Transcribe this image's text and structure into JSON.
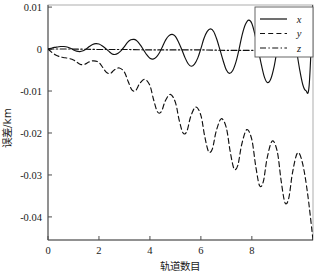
{
  "chart_data": {
    "type": "line",
    "title": "",
    "xlabel": "轨道数目",
    "ylabel": "误差/km",
    "xlim": [
      0,
      10.4
    ],
    "ylim": [
      -0.0455,
      0.0105
    ],
    "grid": false,
    "legend_position": "top-right",
    "xticks": [
      0,
      2,
      4,
      6,
      8
    ],
    "xtick_labels": [
      "0",
      "2",
      "4",
      "6",
      "8"
    ],
    "yticks": [
      0.01,
      0,
      -0.01,
      -0.02,
      -0.03,
      -0.04
    ],
    "ytick_labels": [
      "0.01",
      "0",
      "-0.01",
      "-0.02",
      "-0.03",
      "-0.04"
    ],
    "series": [
      {
        "name": "x",
        "style": "solid",
        "color": "#111111",
        "x": [
          0,
          0.12,
          0.25,
          0.38,
          0.5,
          0.62,
          0.75,
          0.88,
          1.0,
          1.12,
          1.25,
          1.38,
          1.5,
          1.62,
          1.75,
          1.88,
          2.0,
          2.12,
          2.25,
          2.38,
          2.5,
          2.62,
          2.75,
          2.88,
          3.0,
          3.12,
          3.25,
          3.38,
          3.5,
          3.62,
          3.75,
          3.88,
          4.0,
          4.12,
          4.25,
          4.38,
          4.5,
          4.62,
          4.75,
          4.88,
          5.0,
          5.12,
          5.25,
          5.38,
          5.5,
          5.62,
          5.75,
          5.88,
          6.0,
          6.12,
          6.25,
          6.38,
          6.5,
          6.62,
          6.75,
          6.88,
          7.0,
          7.12,
          7.25,
          7.38,
          7.5,
          7.62,
          7.75,
          7.88,
          8.0,
          8.12,
          8.25,
          8.38,
          8.5,
          8.62,
          8.75,
          8.88,
          9.0,
          9.12,
          9.25,
          9.38,
          9.5,
          9.62,
          9.75,
          9.88,
          10.0,
          10.12,
          10.25,
          10.4
        ],
        "y": [
          0.0,
          0.0002,
          0.0004,
          0.0005,
          0.0006,
          0.0006,
          0.0005,
          0.0002,
          -0.0002,
          -0.0005,
          -0.0006,
          -0.0004,
          0.0,
          0.0006,
          0.0011,
          0.0013,
          0.0012,
          0.0008,
          0.0002,
          -0.0005,
          -0.0011,
          -0.0013,
          -0.001,
          -0.0003,
          0.0006,
          0.0016,
          0.0022,
          0.0023,
          0.0019,
          0.001,
          -0.0002,
          -0.0014,
          -0.0022,
          -0.0024,
          -0.0019,
          -0.0008,
          0.0007,
          0.0022,
          0.0032,
          0.0035,
          0.003,
          0.0017,
          -0.0001,
          -0.0021,
          -0.0035,
          -0.0041,
          -0.0036,
          -0.0021,
          0.0001,
          0.0025,
          0.0042,
          0.0048,
          0.0042,
          0.0024,
          -0.0002,
          -0.0029,
          -0.005,
          -0.0058,
          -0.0051,
          -0.003,
          0.0,
          0.0034,
          0.0059,
          0.0069,
          0.0061,
          0.0035,
          -0.0001,
          -0.0039,
          -0.0068,
          -0.008,
          -0.007,
          -0.004,
          0.0002,
          0.0046,
          0.008,
          0.0092,
          0.008,
          0.0045,
          -0.0002,
          -0.005,
          -0.0085,
          -0.0099,
          -0.0086,
          0.0105
        ]
      },
      {
        "name": "y",
        "style": "dashed",
        "color": "#111111",
        "x": [
          0,
          0.15,
          0.3,
          0.45,
          0.6,
          0.8,
          1.0,
          1.15,
          1.3,
          1.45,
          1.6,
          1.8,
          2.0,
          2.15,
          2.3,
          2.45,
          2.6,
          2.8,
          3.0,
          3.15,
          3.3,
          3.45,
          3.6,
          3.8,
          4.0,
          4.15,
          4.3,
          4.45,
          4.6,
          4.8,
          5.0,
          5.15,
          5.3,
          5.45,
          5.6,
          5.8,
          6.0,
          6.15,
          6.3,
          6.45,
          6.6,
          6.8,
          7.0,
          7.15,
          7.3,
          7.45,
          7.6,
          7.8,
          8.0,
          8.15,
          8.3,
          8.45,
          8.6,
          8.8,
          9.0,
          9.15,
          9.3,
          9.45,
          9.6,
          9.8,
          10.0,
          10.2,
          10.4
        ],
        "y": [
          0.0,
          -0.0008,
          -0.0014,
          -0.0018,
          -0.002,
          -0.0022,
          -0.0026,
          -0.0032,
          -0.0037,
          -0.0036,
          -0.0031,
          -0.0028,
          -0.0032,
          -0.0044,
          -0.0056,
          -0.0058,
          -0.005,
          -0.0045,
          -0.0055,
          -0.0078,
          -0.0098,
          -0.0098,
          -0.0082,
          -0.0072,
          -0.0087,
          -0.0122,
          -0.015,
          -0.0149,
          -0.0124,
          -0.0108,
          -0.0127,
          -0.017,
          -0.02,
          -0.0196,
          -0.0161,
          -0.0138,
          -0.0158,
          -0.0208,
          -0.0244,
          -0.0238,
          -0.0196,
          -0.0166,
          -0.0188,
          -0.0244,
          -0.0285,
          -0.0277,
          -0.0228,
          -0.0192,
          -0.0216,
          -0.0278,
          -0.0325,
          -0.0316,
          -0.026,
          -0.0219,
          -0.0245,
          -0.0314,
          -0.0366,
          -0.0355,
          -0.0293,
          -0.0247,
          -0.0275,
          -0.035,
          -0.0455
        ]
      },
      {
        "name": "z",
        "style": "dashdot",
        "color": "#111111",
        "x": [
          0,
          1,
          2,
          3,
          4,
          5,
          6,
          7,
          8,
          9,
          10,
          10.4
        ],
        "y": [
          0.0,
          0.0,
          -0.0001,
          -0.0001,
          -0.0002,
          -0.0002,
          -0.0002,
          -0.0003,
          -0.0003,
          -0.0003,
          -0.0004,
          -0.0004
        ]
      }
    ],
    "legend": [
      {
        "label": "x",
        "style": "solid"
      },
      {
        "label": "y",
        "style": "dashed"
      },
      {
        "label": "z",
        "style": "dashdot"
      }
    ]
  }
}
